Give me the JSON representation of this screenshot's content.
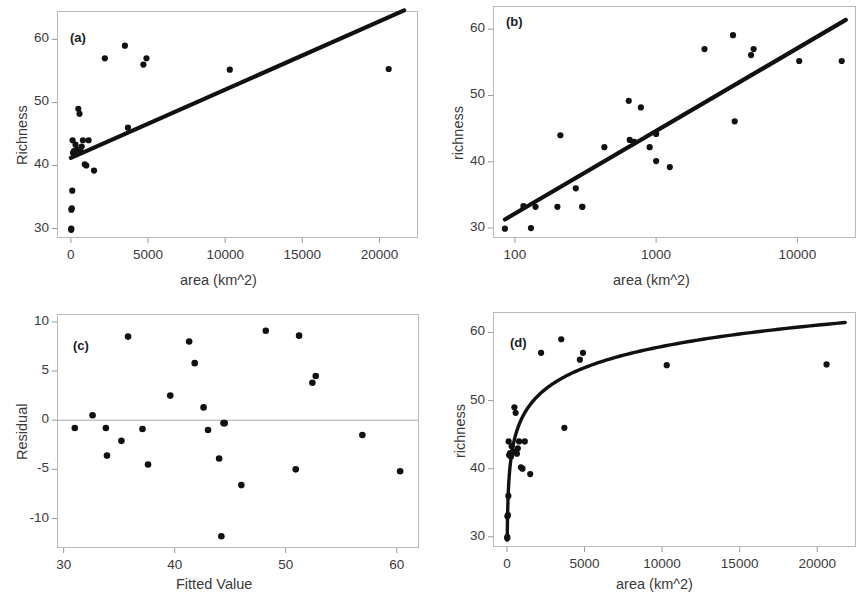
{
  "figure": {
    "panels": [
      "a",
      "b",
      "c",
      "d"
    ]
  },
  "panel_a": {
    "tag": "(a)",
    "xlabel": "area (km^2)",
    "ylabel": "Richness",
    "xticks": [
      "0",
      "5000",
      "10000",
      "15000",
      "20000"
    ],
    "yticks": [
      "30",
      "40",
      "50",
      "60"
    ]
  },
  "panel_b": {
    "tag": "(b)",
    "xlabel": "area (km^2)",
    "ylabel": "richness",
    "xticks": [
      "100",
      "1000",
      "10000"
    ],
    "yticks": [
      "30",
      "40",
      "50",
      "60"
    ]
  },
  "panel_c": {
    "tag": "(c)",
    "xlabel": "Fitted Value",
    "ylabel": "Residual",
    "xticks": [
      "30",
      "40",
      "50",
      "60"
    ],
    "yticks": [
      "10",
      "5",
      "0",
      "-5",
      "-10"
    ]
  },
  "panel_d": {
    "tag": "(d)",
    "xlabel": "area (km^2)",
    "ylabel": "richness",
    "xticks": [
      "0",
      "5000",
      "10000",
      "15000",
      "20000"
    ],
    "yticks": [
      "30",
      "40",
      "50",
      "60"
    ]
  },
  "chart_data": [
    {
      "id": "panel_a",
      "type": "scatter",
      "title": "(a)",
      "xlabel": "area (km^2)",
      "ylabel": "Richness",
      "xlim": [
        -900,
        22500
      ],
      "ylim": [
        28.5,
        64.5
      ],
      "xticks": [
        0,
        5000,
        10000,
        15000,
        20000
      ],
      "yticks": [
        30,
        40,
        50,
        60
      ],
      "grid": false,
      "legend": null,
      "x": [
        20,
        25,
        30,
        60,
        90,
        110,
        140,
        200,
        260,
        300,
        420,
        480,
        560,
        640,
        700,
        780,
        900,
        1000,
        1150,
        1500,
        2200,
        3500,
        3700,
        4700,
        4900,
        10300,
        20600
      ],
      "y": [
        29.8,
        30.0,
        33.0,
        33.2,
        36.0,
        44.0,
        42.0,
        42.3,
        41.8,
        43.3,
        42.5,
        49.0,
        48.2,
        42.2,
        43.0,
        44.0,
        40.2,
        40.0,
        44.0,
        39.2,
        57.0,
        59.0,
        46.0,
        56.0,
        57.0,
        55.2,
        55.3
      ],
      "fit_line": {
        "type": "linear",
        "description": "ordinary least squares fit of Richness on area",
        "x_start": 0,
        "y_start": 41.2,
        "x_end": 21600,
        "y_end": 64.6
      }
    },
    {
      "id": "panel_b",
      "type": "scatter",
      "title": "(b)",
      "xlabel": "area (km^2)",
      "ylabel": "richness",
      "xscale": "log",
      "xlim": [
        70,
        26000
      ],
      "ylim": [
        28.5,
        63.5
      ],
      "xticks": [
        100,
        1000,
        10000
      ],
      "yticks": [
        30,
        40,
        50,
        60
      ],
      "grid": false,
      "legend": null,
      "x": [
        85,
        130,
        115,
        140,
        200,
        210,
        270,
        300,
        300,
        430,
        640,
        650,
        700,
        780,
        900,
        1000,
        1000,
        1250,
        2200,
        3500,
        3600,
        4700,
        4900,
        10300,
        20600
      ],
      "y": [
        29.9,
        30.0,
        33.3,
        33.2,
        33.2,
        44.0,
        36.0,
        33.2,
        33.2,
        42.2,
        49.2,
        43.3,
        43.0,
        48.2,
        42.2,
        44.2,
        40.1,
        39.2,
        57.0,
        59.1,
        46.1,
        56.1,
        57.0,
        55.2,
        55.2
      ],
      "fit_line": {
        "type": "linear-on-log-x",
        "description": "least squares fit of richness on log(area)",
        "x_start": 85,
        "y_start": 31.3,
        "x_end": 22000,
        "y_end": 61.4
      }
    },
    {
      "id": "panel_c",
      "type": "scatter",
      "title": "(c)",
      "xlabel": "Fitted Value",
      "ylabel": "Residual",
      "xlim": [
        29.4,
        62.0
      ],
      "ylim": [
        -13.0,
        10.8
      ],
      "xticks": [
        30,
        40,
        50,
        60
      ],
      "yticks": [
        -10,
        -5,
        0,
        5,
        10
      ],
      "grid": false,
      "legend": null,
      "reference_line_y": 0,
      "x": [
        31.0,
        32.6,
        33.8,
        33.9,
        35.2,
        35.8,
        37.1,
        37.6,
        39.6,
        41.3,
        41.8,
        42.6,
        43.0,
        44.0,
        44.2,
        44.4,
        44.5,
        46.0,
        48.2,
        50.9,
        51.2,
        52.4,
        52.7,
        56.9,
        60.3
      ],
      "y": [
        -0.8,
        0.5,
        -0.8,
        -3.6,
        -2.1,
        8.5,
        -0.9,
        -4.5,
        2.5,
        8.0,
        5.8,
        1.3,
        -1.0,
        -3.9,
        -11.8,
        -0.3,
        -0.3,
        -6.6,
        9.1,
        -5.0,
        8.6,
        3.8,
        4.5,
        -1.5,
        -5.2
      ]
    },
    {
      "id": "panel_d",
      "type": "scatter",
      "title": "(d)",
      "xlabel": "area (km^2)",
      "ylabel": "richness",
      "xlim": [
        -900,
        22500
      ],
      "ylim": [
        28.5,
        63.0
      ],
      "xticks": [
        0,
        5000,
        10000,
        15000,
        20000
      ],
      "yticks": [
        30,
        40,
        50,
        60
      ],
      "grid": false,
      "legend": null,
      "x": [
        20,
        25,
        30,
        60,
        90,
        110,
        140,
        200,
        260,
        300,
        420,
        480,
        560,
        640,
        700,
        780,
        900,
        1000,
        1150,
        1500,
        2200,
        3500,
        3700,
        4700,
        4900,
        10300,
        20600
      ],
      "y": [
        29.8,
        30.0,
        33.0,
        33.2,
        36.0,
        44.0,
        42.0,
        42.3,
        41.8,
        43.3,
        42.5,
        49.0,
        48.2,
        42.2,
        43.0,
        44.0,
        40.2,
        40.0,
        44.0,
        39.2,
        57.0,
        59.0,
        46.0,
        56.0,
        57.0,
        55.2,
        55.3
      ],
      "fit_line": {
        "type": "logarithmic",
        "description": "fitted curve richness = a + b*log(area), back-transformed to linear area axis",
        "intercept": 16.5,
        "slope": 4.5
      }
    }
  ]
}
